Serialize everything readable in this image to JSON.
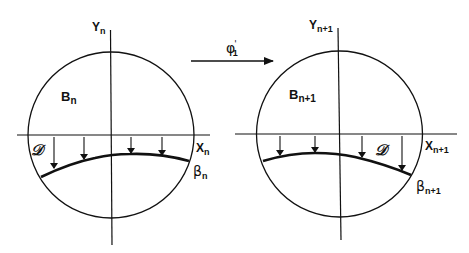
{
  "diagram": {
    "colors": {
      "stroke": "#111111",
      "background": "#ffffff"
    },
    "map": {
      "label": "φ",
      "prime": "'",
      "subscript": "1",
      "direction": "left-to-right"
    },
    "left": {
      "y_axis": {
        "label": "Y",
        "sub": "n"
      },
      "x_axis": {
        "label": "X",
        "sub": "n"
      },
      "region": {
        "label": "B",
        "sub": "n"
      },
      "domain_label": "𝒟",
      "curve": {
        "label": "β",
        "sub": "n"
      },
      "arrows_count": 4
    },
    "right": {
      "y_axis": {
        "label": "Y",
        "sub": "n+1"
      },
      "x_axis": {
        "label": "X",
        "sub": "n+1"
      },
      "region": {
        "label": "B",
        "sub": "n+1"
      },
      "domain_label": "𝒟",
      "curve": {
        "label": "β",
        "sub": "n+1"
      },
      "arrows_count": 4
    }
  }
}
